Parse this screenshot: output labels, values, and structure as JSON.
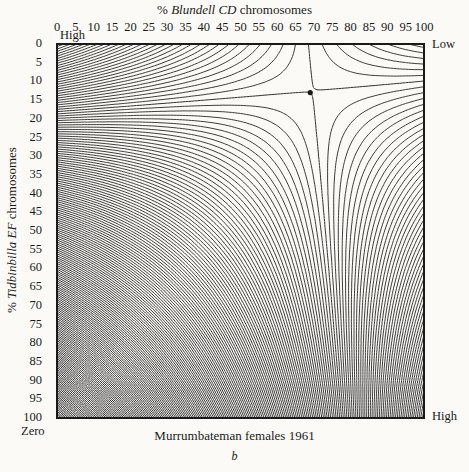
{
  "chart_data": {
    "type": "contour",
    "title": "",
    "xlabel_prefix": "% ",
    "xlabel_italic": "Blundell CD",
    "xlabel_suffix": " chromosomes",
    "ylabel_prefix": "% ",
    "ylabel_italic": "Tidbinbilla EF",
    "ylabel_suffix": " chromosomes",
    "x_ticks": [
      "0",
      "5",
      "10",
      "15",
      "20",
      "25",
      "30",
      "35",
      "40",
      "45",
      "50",
      "55",
      "60",
      "65",
      "70",
      "75",
      "80",
      "85",
      "90",
      "95",
      "100"
    ],
    "y_ticks": [
      "0",
      "5",
      "10",
      "15",
      "20",
      "25",
      "30",
      "35",
      "40",
      "45",
      "50",
      "55",
      "60",
      "65",
      "70",
      "75",
      "80",
      "85",
      "90",
      "95",
      "100"
    ],
    "xlim": [
      0,
      100
    ],
    "ylim": [
      0,
      100
    ],
    "y_inverted": true,
    "x_axis_position": "top",
    "grid": false,
    "corner_labels": {
      "top_left": "High",
      "top_right": "Low",
      "bottom_left": "Zero",
      "bottom_right": "High"
    },
    "saddle_point": {
      "x": 69,
      "y": 13
    },
    "dashed_contour_description": "Separatrix through saddle: enters left edge at ~20%, exits bottom at ~76%; second branch from top at ~64% to right edge at ~6%",
    "caption": "Murrumbateman females 1961",
    "panel_label": "b"
  },
  "labels": {
    "top_title_prefix": "% ",
    "top_title_italic": "Blundell CD",
    "top_title_suffix": " chromosomes",
    "left_title_prefix": "% ",
    "left_title_italic": "Tidbinbilla EF",
    "left_title_suffix": " chromosomes",
    "corner_top_left": "High",
    "corner_top_right": "Low",
    "corner_bottom_left": "Zero",
    "corner_bottom_right": "High",
    "caption": "Murrumbateman females 1961",
    "panel_label": "b"
  },
  "plot": {
    "left": 57,
    "top": 44,
    "right": 424,
    "bottom": 418,
    "stroke_color": "#1a1a1a",
    "frame_width": 2
  }
}
